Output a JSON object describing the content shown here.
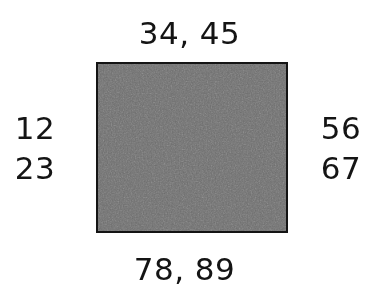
{
  "figure": {
    "type": "annotated-rectangle-diagram",
    "canvas": {
      "width": 377,
      "height": 304,
      "background_color": "#ffffff"
    },
    "shape": {
      "name": "rectangle",
      "fill_color": "#6e6e6e",
      "border_color": "#141414",
      "border_width_px": 2,
      "x": 96,
      "y": 62,
      "width": 192,
      "height": 171,
      "texture": "scanned-halftone-noise"
    },
    "text_color": "#141414",
    "font_size_px": 31
  },
  "labels": {
    "top": {
      "text": "34, 45",
      "position": "above-rectangle"
    },
    "bottom": {
      "text": "78, 89",
      "position": "below-rectangle"
    },
    "left": {
      "position": "left-of-rectangle",
      "values": [
        "12",
        "23"
      ]
    },
    "right": {
      "position": "right-of-rectangle",
      "values": [
        "56",
        "67"
      ]
    }
  }
}
